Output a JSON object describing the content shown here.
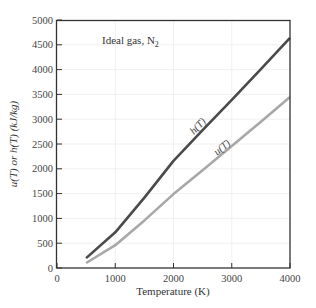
{
  "chart_data": {
    "type": "line",
    "title": "",
    "annotation": "Ideal gas, N",
    "annotation_subscript": "2",
    "xlabel": "Temperature (K)",
    "ylabel": "u(T) or h(T) (kJ/kg)",
    "xlim": [
      0,
      4000
    ],
    "ylim": [
      0,
      5000
    ],
    "xticks": [
      0,
      1000,
      2000,
      3000,
      4000
    ],
    "yticks": [
      0,
      500,
      1000,
      1500,
      2000,
      2500,
      3000,
      3500,
      4000,
      4500,
      5000
    ],
    "grid": true,
    "legend": "none (inline curve labels)",
    "series": [
      {
        "name": "h(T)",
        "label_text": "h(T)",
        "color": "#4a4a4a",
        "x": [
          500,
          1000,
          1500,
          2000,
          2500,
          3000,
          3500,
          4000
        ],
        "y": [
          200,
          720,
          1420,
          2160,
          2780,
          3390,
          4010,
          4640
        ]
      },
      {
        "name": "u(T)",
        "label_text": "u(T)",
        "color": "#a8a8a8",
        "x": [
          500,
          1000,
          1500,
          2000,
          2500,
          3000,
          3500,
          4000
        ],
        "y": [
          100,
          460,
          960,
          1490,
          1970,
          2460,
          2950,
          3450
        ]
      }
    ]
  },
  "colors": {
    "axis": "#333333",
    "grid": "#ececec",
    "h_curve": "#4a4a4a",
    "u_curve": "#a8a8a8"
  }
}
